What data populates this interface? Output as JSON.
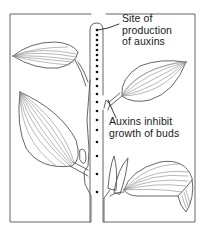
{
  "diagram": {
    "labels": {
      "site": {
        "line1": "Site of",
        "line2": "production",
        "line3": "of auxins"
      },
      "inhibit": {
        "line1": "Auxins inhibit",
        "line2": "growth of buds"
      }
    },
    "elements": [
      "frame",
      "stem",
      "auxin-dots",
      "upper-left-leaf",
      "lower-left-leaf",
      "upper-right-leaf",
      "lower-right-leaf",
      "axillary-bud-upper",
      "axillary-bud-lower"
    ],
    "dot_count": 20,
    "colors": {
      "line": "#555555",
      "vein": "#777777",
      "dot": "#111111",
      "text": "#1a1a1a",
      "background": "#ffffff"
    }
  }
}
